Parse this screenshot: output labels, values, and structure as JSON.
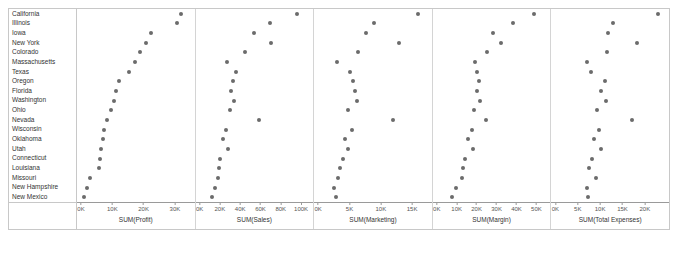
{
  "chart_data": {
    "type": "scatter",
    "title": "",
    "subtitle": "",
    "layout": "small-multiples-dot-plot",
    "grid": false,
    "legend": null,
    "ylabel": "State",
    "categories": [
      "California",
      "Illinois",
      "Iowa",
      "New York",
      "Colorado",
      "Massachusetts",
      "Texas",
      "Oregon",
      "Florida",
      "Washington",
      "Ohio",
      "Nevada",
      "Wisconsin",
      "Oklahoma",
      "Utah",
      "Connecticut",
      "Louisiana",
      "Missouri",
      "New Hampshire",
      "New Mexico"
    ],
    "panels": [
      {
        "id": "profit",
        "xlabel": "SUM(Profit)",
        "xlim": [
          0,
          35000
        ],
        "ticks": [
          0,
          10000,
          20000,
          30000
        ],
        "tick_labels": [
          "0K",
          "10K",
          "20K",
          "30K"
        ],
        "values": [
          31800,
          30500,
          22300,
          20700,
          18900,
          17100,
          15200,
          12100,
          11300,
          10400,
          9500,
          8200,
          7500,
          6900,
          6500,
          6100,
          5600,
          3000,
          1800,
          900
        ]
      },
      {
        "id": "sales",
        "xlabel": "SUM(Sales)",
        "xlim": [
          0,
          108000
        ],
        "ticks": [
          0,
          20000,
          40000,
          60000,
          80000,
          100000
        ],
        "tick_labels": [
          "0K",
          "20K",
          "40K",
          "60K",
          "80K",
          "100K"
        ],
        "values": [
          96000,
          69000,
          54000,
          70000,
          45000,
          27000,
          36000,
          33000,
          31000,
          34000,
          30000,
          59000,
          26000,
          23000,
          28000,
          20000,
          19000,
          18000,
          15000,
          12000
        ]
      },
      {
        "id": "marketing",
        "xlabel": "SUM(Marketing)",
        "xlim": [
          0,
          17500
        ],
        "ticks": [
          0,
          5000,
          10000,
          15000
        ],
        "tick_labels": [
          "0K",
          "5K",
          "10K",
          "15K"
        ],
        "values": [
          16000,
          8900,
          7700,
          12900,
          6400,
          3000,
          5000,
          5600,
          5900,
          6200,
          4700,
          11900,
          5400,
          4300,
          4800,
          3900,
          3500,
          3100,
          2600,
          2900
        ]
      },
      {
        "id": "margin",
        "xlabel": "SUM(Margin)",
        "xlim": [
          0,
          55000
        ],
        "ticks": [
          0,
          10000,
          20000,
          30000,
          40000,
          50000
        ],
        "tick_labels": [
          "0K",
          "10K",
          "20K",
          "30K",
          "40K",
          "50K"
        ],
        "values": [
          49000,
          38000,
          28000,
          32000,
          25000,
          19000,
          20000,
          21000,
          20200,
          21500,
          18500,
          24500,
          17500,
          15500,
          18000,
          14000,
          13200,
          12500,
          9500,
          7800
        ]
      },
      {
        "id": "total_expenses",
        "xlabel": "SUM(Total Expenses)",
        "xlim": [
          0,
          24500
        ],
        "ticks": [
          0,
          5000,
          10000,
          15000,
          20000
        ],
        "tick_labels": [
          "0K",
          "5K",
          "10K",
          "15K",
          "20K"
        ],
        "values": [
          23000,
          12900,
          11700,
          18200,
          11600,
          7100,
          8000,
          11000,
          10200,
          11300,
          9300,
          17200,
          9800,
          8700,
          10100,
          8200,
          7500,
          9000,
          7000,
          7400
        ]
      }
    ]
  }
}
